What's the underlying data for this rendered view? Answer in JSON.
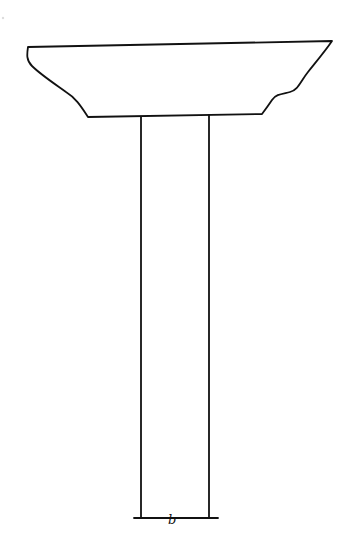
{
  "diagram": {
    "components": [
      {
        "id": "pier-cap",
        "label": "Pier cap",
        "description": "Trapezoidal cap with curved haunches on both sides"
      },
      {
        "id": "column",
        "label": "Column",
        "description": "Vertical rectangular column supporting the cap"
      },
      {
        "id": "base-line",
        "label": "Base dimension line"
      }
    ],
    "dimension_label": "b",
    "stroke_color": "#111111",
    "background_color": "#ffffff"
  }
}
